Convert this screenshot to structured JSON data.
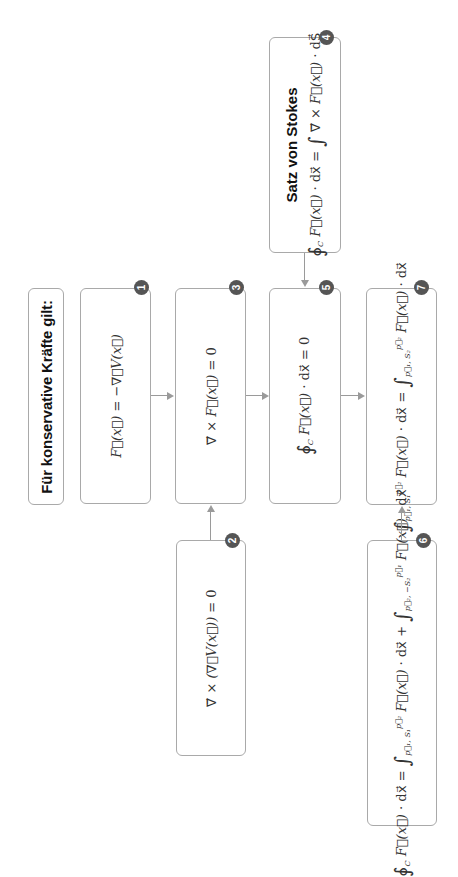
{
  "title": "Für konservative Kräfte gilt:",
  "boxes": [
    {
      "id": 1,
      "badge": "1",
      "formula": "F⃗(x⃗) = −∇⃗V(x⃗)"
    },
    {
      "id": 2,
      "badge": "2",
      "formula": "∇⃗ × (∇⃗V(x⃗)) = 0"
    },
    {
      "id": 3,
      "badge": "3",
      "formula": "∇⃗ × F⃗(x⃗) = 0"
    },
    {
      "id": 4,
      "badge": "4",
      "heading": "Satz von Stokes",
      "formula": "∮_C F⃗(x⃗) · dx⃗ = ∫ ∇⃗ × F⃗(x⃗) · dS⃗"
    },
    {
      "id": 5,
      "badge": "5",
      "formula": "∮_C F⃗(x⃗) · dx⃗ = 0"
    },
    {
      "id": 6,
      "badge": "6",
      "formula": "∮_C F⃗(x⃗) · dx⃗ = ∫_{p⃗1,S1}^{p⃗2} F⃗(x⃗) · dx⃗ + ∫_{p⃗2,−S2}^{p⃗1} F⃗(x⃗) · dx⃗"
    },
    {
      "id": 7,
      "badge": "7",
      "formula": "∫_{p⃗1,S1}^{p⃗2} F⃗(x⃗) · dx⃗ = ∫_{p⃗1,S2}^{p⃗2} F⃗(x⃗) · dx⃗"
    }
  ],
  "parts": {
    "f": "F⃗(x⃗)",
    "eq": " = ",
    "minus_grad_v": "−∇⃗V(x⃗)",
    "curl": "∇⃗ × ",
    "grad_v_paren": "(∇⃗V(x⃗))",
    "zero": " = 0",
    "oint": "∮",
    "int": "∫",
    "c": "C",
    "dot_dx": " · dx⃗",
    "dot_ds": " · dS⃗",
    "plus": " + ",
    "p1": "p⃗₁",
    "p2": "p⃗₂",
    "p1s1": "p⃗₁, S₁",
    "p1s2": "p⃗₁, S₂",
    "p2ms2": "p⃗₂, −S₂"
  },
  "arrows": [
    {
      "from": 1,
      "to": 3
    },
    {
      "from": 2,
      "to": 3
    },
    {
      "from": 3,
      "to": 5
    },
    {
      "from": 4,
      "to": 5
    },
    {
      "from": 5,
      "to": 7
    },
    {
      "from": 6,
      "to": 7
    }
  ],
  "colors": {
    "border": "#a9a9a9",
    "badge": "#555555",
    "arrow": "#9a9a9a",
    "text": "#222222"
  }
}
